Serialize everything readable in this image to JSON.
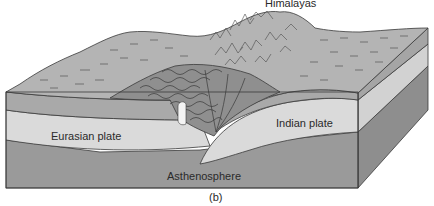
{
  "figure": {
    "caption": "(b)",
    "labels": {
      "himalayas": "Himalayas",
      "eurasian_plate": "Eurasian plate",
      "indian_plate": "Indian plate",
      "asthenosphere": "Asthenosphere"
    },
    "colors": {
      "surface": "#b4b4b4",
      "upper_crust_band": "#a9a9a9",
      "plate_band": "#dadada",
      "asthenosphere": "#9a9a9a",
      "side_face_dark": "#8e8e8e",
      "folded_rock": "#8f8f8f",
      "outline": "#3a3a3a",
      "background": "#ffffff"
    }
  }
}
